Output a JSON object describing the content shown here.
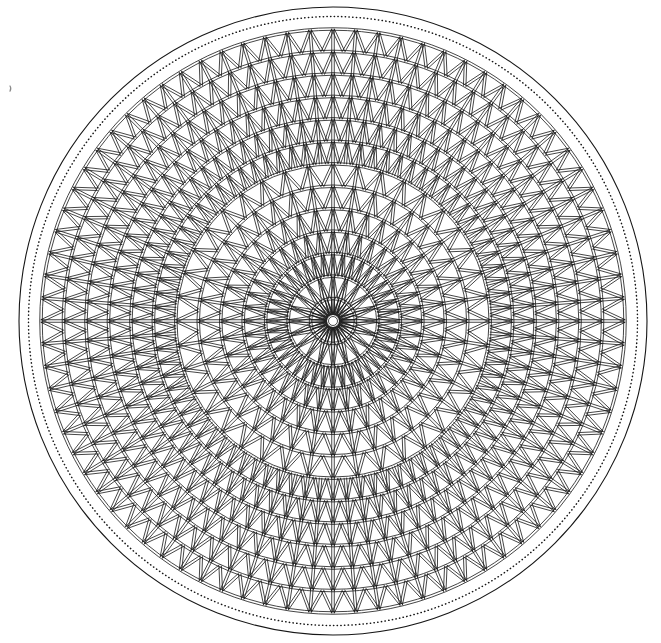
{
  "canvas": {
    "width": 661,
    "height": 643,
    "background_color": "#ffffff"
  },
  "figure": {
    "center_x": 333,
    "center_y": 321,
    "outer_circle_radius": 314,
    "outer_circle_stroke_width": 1.1,
    "dotted_circle_radius": 304.5,
    "dotted_stroke_width": 1.5,
    "dot_dash_pattern": "0.3 3.4",
    "lattice_radius": 292,
    "ring_count": 13,
    "hub_radius": 6,
    "stroke_color": "#161616",
    "stroke_width": 0.8,
    "member_rail_gap": 2.5,
    "sector_schedule": [
      {
        "from_ring": 0,
        "to_ring": 2,
        "sectors": 20
      },
      {
        "from_ring": 2,
        "to_ring": 7,
        "sectors": 40
      },
      {
        "from_ring": 7,
        "to_ring": 13,
        "sectors": 80
      }
    ],
    "stray_mark": {
      "x": 10,
      "y": 86,
      "color": "#8a8a8a"
    }
  }
}
